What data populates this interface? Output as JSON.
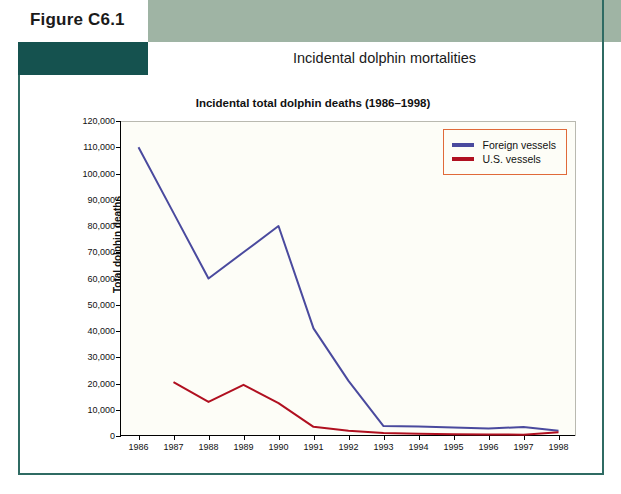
{
  "figure": {
    "label": "Figure C6.1",
    "header_title": "Incidental dolphin mortalities"
  },
  "colors": {
    "band_green": "#9fb4a4",
    "band_teal": "#15524f",
    "frame": "#2f6b63",
    "foreign_vessels": "#4a4a9e",
    "us_vessels": "#b01020",
    "legend_border": "#e06a3a",
    "plot_background": "#fdfdf7"
  },
  "chart_data": {
    "type": "line",
    "title": "Incidental total dolphin deaths (1986–1998)",
    "xlabel": "",
    "ylabel": "Total dolphin deaths",
    "categories": [
      "1986",
      "1987",
      "1988",
      "1989",
      "1990",
      "1991",
      "1992",
      "1993",
      "1994",
      "1995",
      "1996",
      "1997",
      "1998"
    ],
    "ylim": [
      0,
      120000
    ],
    "yticks": [
      "0",
      "10,000",
      "20,000",
      "30,000",
      "40,000",
      "50,000",
      "60,000",
      "70,000",
      "80,000",
      "90,000",
      "100,000",
      "110,000",
      "120,000"
    ],
    "ytick_values": [
      0,
      10000,
      20000,
      30000,
      40000,
      50000,
      60000,
      70000,
      80000,
      90000,
      100000,
      110000,
      120000
    ],
    "grid": false,
    "legend_position": "top-right",
    "series": [
      {
        "name": "Foreign vessels",
        "color": "#4a4a9e",
        "values": [
          110000,
          85000,
          60000,
          70000,
          80000,
          41000,
          21000,
          3800,
          3600,
          3200,
          2900,
          3400,
          2000
        ]
      },
      {
        "name": "U.S. vessels",
        "color": "#b01020",
        "values": [
          null,
          20500,
          13000,
          19500,
          12500,
          3500,
          2000,
          1100,
          900,
          700,
          600,
          500,
          1400
        ]
      }
    ]
  },
  "legend": {
    "items": [
      {
        "label": "Foreign vessels",
        "color": "#4a4a9e"
      },
      {
        "label": "U.S. vessels",
        "color": "#b01020"
      }
    ]
  }
}
